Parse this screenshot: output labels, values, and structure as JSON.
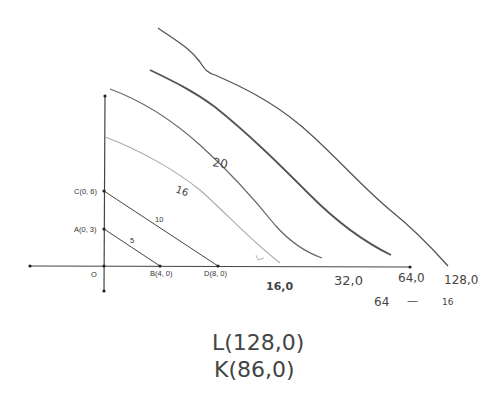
{
  "diagram": {
    "origin_label": "O",
    "points": {
      "A": "A(0, 3)",
      "B": "B(4, 0)",
      "C": "C(0, 6)",
      "D": "D(8, 0)"
    },
    "line_labels": {
      "line_5": "5",
      "line_10": "10",
      "curve_16": "16",
      "curve_20": "20"
    },
    "axis_annotations": {
      "a16": "16,0",
      "a32": "32,0",
      "a64": "64,0",
      "a128": "128,0",
      "below_64": "64",
      "dash": "—",
      "below_128": "16"
    },
    "notes": {
      "L": "L(128,0)",
      "K": "K(86,0)"
    }
  }
}
